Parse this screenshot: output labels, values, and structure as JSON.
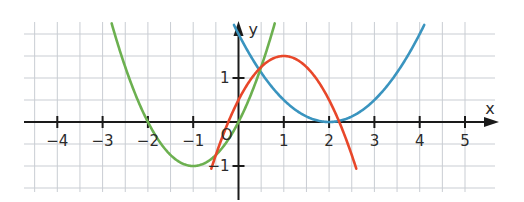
{
  "chart_data": {
    "type": "line",
    "title": "",
    "xlabel": "x",
    "ylabel": "y",
    "xlim": [
      -4.75,
      5.75
    ],
    "ylim": [
      -1.6,
      2.3
    ],
    "grid": true,
    "grid_step": 0.5,
    "x_ticks": [
      -4,
      -3,
      -2,
      -1,
      1,
      2,
      3,
      4,
      5
    ],
    "x_tick_labels": [
      "−4",
      "−3",
      "−2",
      "−1",
      "1",
      "2",
      "3",
      "4",
      "5"
    ],
    "y_ticks": [
      1,
      -1
    ],
    "y_tick_labels": [
      "1",
      "−1"
    ],
    "origin_label": "O",
    "legend": null,
    "series": [
      {
        "name": "green parabola",
        "color": "#6cb050",
        "formula": "y = x^2 + 2x",
        "vertex": [
          -1,
          -1
        ],
        "points": [
          [
            -2.8,
            2.24
          ],
          [
            -2.5,
            1.25
          ],
          [
            -2,
            0
          ],
          [
            -1.5,
            -0.75
          ],
          [
            -1,
            -1
          ],
          [
            -0.5,
            -0.75
          ],
          [
            0,
            0
          ],
          [
            0.5,
            1.25
          ],
          [
            0.8,
            2.24
          ]
        ]
      },
      {
        "name": "blue parabola",
        "color": "#3a94bf",
        "formula": "y = 0.5(x-2)^2",
        "vertex": [
          2,
          0
        ],
        "points": [
          [
            -0.1,
            2.2
          ],
          [
            0,
            2
          ],
          [
            0.5,
            1.125
          ],
          [
            1,
            0.5
          ],
          [
            1.5,
            0.125
          ],
          [
            2,
            0
          ],
          [
            2.5,
            0.125
          ],
          [
            3,
            0.5
          ],
          [
            3.5,
            1.125
          ],
          [
            4,
            2
          ],
          [
            4.1,
            2.2
          ]
        ]
      },
      {
        "name": "red parabola",
        "color": "#e8472a",
        "formula": "y = -(x-1)^2 + 1.5",
        "vertex": [
          1,
          1.5
        ],
        "points": [
          [
            -0.6,
            -1.06
          ],
          [
            -0.5,
            -0.75
          ],
          [
            0,
            0.5
          ],
          [
            0.5,
            1.25
          ],
          [
            1,
            1.5
          ],
          [
            1.5,
            1.25
          ],
          [
            2,
            0.5
          ],
          [
            2.5,
            -0.75
          ],
          [
            2.6,
            -1.06
          ]
        ]
      }
    ]
  },
  "colors": {
    "grid": "#c9cdd3",
    "axis": "#1a1a1a",
    "green": "#6cb050",
    "blue": "#3a94bf",
    "red": "#e8472a"
  }
}
